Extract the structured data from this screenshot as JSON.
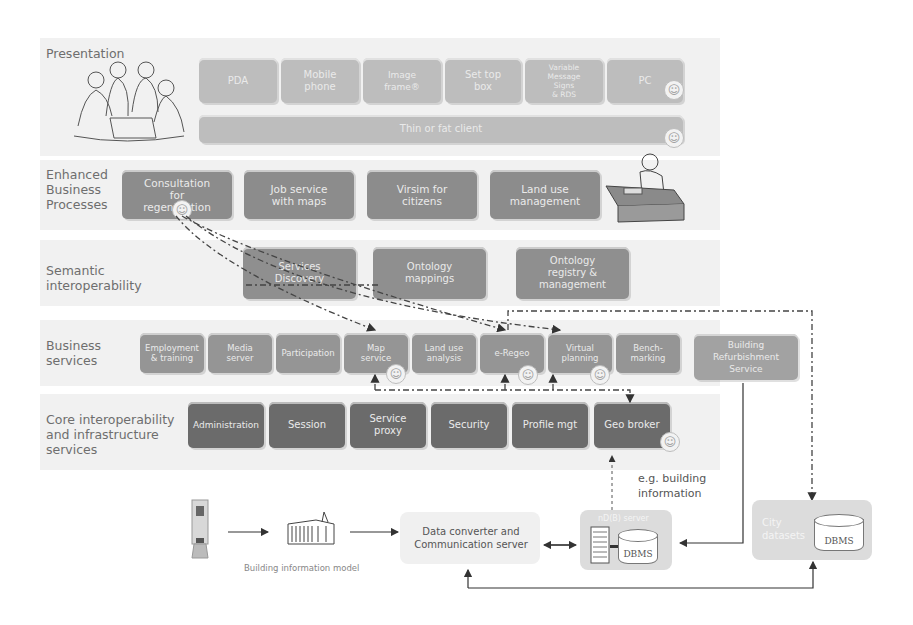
{
  "layers": {
    "presentation": "Presentation",
    "enhanced": "Enhanced\nBusiness\nProcesses",
    "semantic": "Semantic\ninteroperability",
    "business": "Business\nservices",
    "core": "Core interoperability\nand infrastructure\nservices"
  },
  "presentation_devices": [
    "PDA",
    "Mobile\nphone",
    "Image\nframe®",
    "Set top\nbox",
    "Variable\nMessage\nSigns\n& RDS",
    "PC"
  ],
  "thin_client": "Thin or fat client",
  "enhanced_processes": [
    "Consultation\nfor\nregeneration",
    "Job service\nwith maps",
    "Virsim for\ncitizens",
    "Land use\nmanagement"
  ],
  "semantic_services": [
    "Services\nDiscovery",
    "Ontology\nmappings",
    "Ontology\nregistry &\nmanagement"
  ],
  "business_services": [
    "Employment\n& training",
    "Media\nserver",
    "Participation",
    "Map\nservice",
    "Land use\nanalysis",
    "e-Regeo",
    "Virtual\nplanning",
    "Bench-\nmarking"
  ],
  "building_refurbishment": "Building\nRefurbishment\nService",
  "core_services": [
    "Administration",
    "Session",
    "Service\nproxy",
    "Security",
    "Profile mgt",
    "Geo broker"
  ],
  "eg_label": "e.g. building\ninformation",
  "bim_label": "Building information model",
  "data_converter": "Data converter and\nCommunication server",
  "nd_server_label": "nD(B) server",
  "dbms_label": "DBMS",
  "city_datasets_label": "City\ndatasets",
  "smiley_glyph": "☺"
}
